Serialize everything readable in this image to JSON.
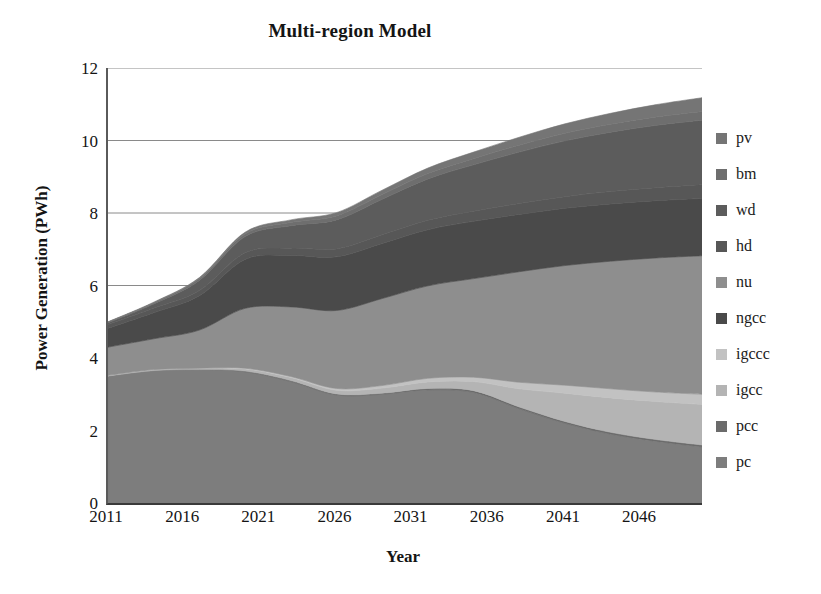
{
  "chart": {
    "title": "Multi-region Model",
    "xlabel": "Year",
    "ylabel": "Power Generation (PWh)"
  },
  "axes": {
    "y_ticks": [
      "12",
      "10",
      "8",
      "6",
      "4",
      "2",
      "0"
    ],
    "x_ticks": [
      "2011",
      "2016",
      "2021",
      "2026",
      "2031",
      "2036",
      "2041",
      "2046"
    ]
  },
  "legend": {
    "items": [
      {
        "label": "pv",
        "color": "#757575"
      },
      {
        "label": "bm",
        "color": "#6e6e6e"
      },
      {
        "label": "wd",
        "color": "#5c5c5c"
      },
      {
        "label": "hd",
        "color": "#575757"
      },
      {
        "label": "nu",
        "color": "#8e8e8e"
      },
      {
        "label": "ngcc",
        "color": "#4a4a4a"
      },
      {
        "label": "igccc",
        "color": "#c2c2c2"
      },
      {
        "label": "igcc",
        "color": "#b4b4b4"
      },
      {
        "label": "pcc",
        "color": "#6b6b6b"
      },
      {
        "label": "pc",
        "color": "#7d7d7d"
      }
    ]
  },
  "chart_data": {
    "type": "area",
    "title": "Multi-region Model",
    "xlabel": "Year",
    "ylabel": "Power Generation (PWh)",
    "xlim": [
      2011,
      2050
    ],
    "ylim": [
      0,
      12
    ],
    "grid": true,
    "legend_position": "right",
    "stacked": true,
    "x": [
      2011,
      2014,
      2017,
      2020,
      2023,
      2026,
      2029,
      2032,
      2035,
      2038,
      2041,
      2044,
      2047,
      2050
    ],
    "series": [
      {
        "name": "pc",
        "color": "#7d7d7d",
        "values": [
          3.5,
          3.65,
          3.68,
          3.62,
          3.35,
          2.98,
          3.0,
          3.12,
          3.05,
          2.6,
          2.2,
          1.9,
          1.7,
          1.55
        ]
      },
      {
        "name": "pcc",
        "color": "#6b6b6b",
        "values": [
          0.0,
          0.0,
          0.0,
          0.02,
          0.03,
          0.03,
          0.03,
          0.04,
          0.05,
          0.05,
          0.05,
          0.05,
          0.05,
          0.05
        ]
      },
      {
        "name": "igcc",
        "color": "#b4b4b4",
        "values": [
          0.02,
          0.03,
          0.04,
          0.06,
          0.08,
          0.1,
          0.14,
          0.18,
          0.25,
          0.5,
          0.78,
          0.95,
          1.05,
          1.12
        ]
      },
      {
        "name": "igccc",
        "color": "#c2c2c2",
        "values": [
          0.0,
          0.0,
          0.0,
          0.02,
          0.03,
          0.05,
          0.07,
          0.1,
          0.12,
          0.18,
          0.22,
          0.25,
          0.26,
          0.28
        ]
      },
      {
        "name": "nu",
        "color": "#8e8e8e",
        "values": [
          0.78,
          0.85,
          1.05,
          1.65,
          1.92,
          2.15,
          2.4,
          2.55,
          2.72,
          3.05,
          3.3,
          3.52,
          3.7,
          3.82
        ]
      },
      {
        "name": "ngcc",
        "color": "#4a4a4a",
        "values": [
          0.52,
          0.72,
          0.95,
          1.35,
          1.42,
          1.48,
          1.52,
          1.55,
          1.58,
          1.58,
          1.58,
          1.58,
          1.58,
          1.58
        ]
      },
      {
        "name": "hd",
        "color": "#575757",
        "values": [
          0.1,
          0.12,
          0.14,
          0.18,
          0.2,
          0.22,
          0.24,
          0.26,
          0.28,
          0.3,
          0.32,
          0.34,
          0.36,
          0.38
        ]
      },
      {
        "name": "wd",
        "color": "#5c5c5c",
        "values": [
          0.05,
          0.12,
          0.28,
          0.45,
          0.62,
          0.8,
          0.98,
          1.14,
          1.28,
          1.42,
          1.54,
          1.64,
          1.72,
          1.78
        ]
      },
      {
        "name": "bm",
        "color": "#6e6e6e",
        "values": [
          0.02,
          0.03,
          0.05,
          0.07,
          0.09,
          0.11,
          0.13,
          0.15,
          0.17,
          0.19,
          0.21,
          0.22,
          0.23,
          0.24
        ]
      },
      {
        "name": "pv",
        "color": "#757575",
        "values": [
          0.01,
          0.02,
          0.03,
          0.05,
          0.07,
          0.09,
          0.12,
          0.15,
          0.18,
          0.22,
          0.26,
          0.3,
          0.34,
          0.38
        ]
      }
    ],
    "totals": [
      5.0,
      5.54,
      6.22,
      7.47,
      7.81,
      8.01,
      8.63,
      9.24,
      9.68,
      10.09,
      10.46,
      10.75,
      10.99,
      11.18
    ]
  }
}
